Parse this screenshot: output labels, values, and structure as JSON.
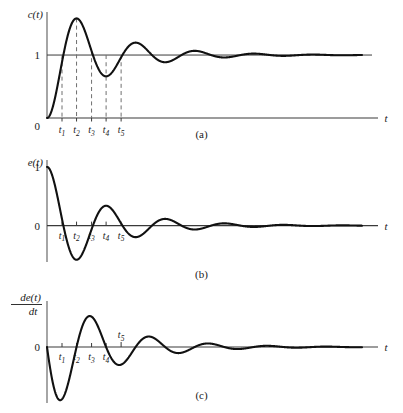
{
  "figure": {
    "background": "#ffffff",
    "ink": "#111111",
    "axis_color": "#3a3a3a",
    "dash_color": "#6f6f6f"
  },
  "panels": [
    {
      "id": "a",
      "caption": "(a)",
      "ylabel": "c(t)",
      "xlabel": "t",
      "origin_label": "0",
      "level_label": "1",
      "tick_labels": [
        "t1",
        "t2",
        "t3",
        "t4",
        "t5"
      ],
      "tick_sub": [
        "1",
        "2",
        "3",
        "4",
        "5"
      ],
      "tick_label_base": "t",
      "tick_label_position": "below-axis",
      "has_dashed_droplines": true,
      "has_level_line": true,
      "description": "Underdamped second-order step response rising from 0, overshooting the steady-state value 1, then ringing down to 1."
    },
    {
      "id": "b",
      "caption": "(b)",
      "ylabel": "e(t)",
      "xlabel": "t",
      "origin_label": "0",
      "level_label": "1",
      "tick_labels": [
        "t1",
        "t2",
        "t3",
        "t4",
        "t5"
      ],
      "tick_sub": [
        "1",
        "2",
        "3",
        "4",
        "5"
      ],
      "tick_label_base": "t",
      "tick_label_position": "below-axis",
      "has_dashed_droplines": false,
      "has_level_line": false,
      "description": "Error signal e(t) = 1 - c(t), starting at 1 and oscillating with decaying amplitude about 0."
    },
    {
      "id": "c",
      "caption": "(c)",
      "ylabel_numerator": "de(t)",
      "ylabel_denominator": "dt",
      "xlabel": "t",
      "origin_label": "0",
      "tick_labels": [
        "t1",
        "t2",
        "t3",
        "t4",
        "t5"
      ],
      "tick_sub": [
        "1",
        "2",
        "3",
        "4",
        "5"
      ],
      "tick_label_base": "t",
      "tick_label_position": "below-axis-except-t5",
      "t5_label_position": "above-axis",
      "has_dashed_droplines": false,
      "has_level_line": false,
      "description": "Derivative of the error signal, starting at 0, dipping negative first, then oscillating with decaying amplitude about 0."
    }
  ],
  "chart_data": {
    "type": "line",
    "title": "",
    "xlabel": "t",
    "plots": [
      {
        "name": "c(t)",
        "panel": "a",
        "ylabel": "c(t)",
        "yticks": [
          0,
          1
        ],
        "ytick_labels": [
          "0",
          "1"
        ],
        "model": "step_response",
        "formula": "c(t) = 1 - exp(-z*wn*t)*(cos(wd*t) + (z*wn/wd)*sin(wd*t))",
        "zeta": 0.17,
        "wn": 1.0,
        "wd": 0.98536,
        "xlim": [
          0,
          34
        ],
        "ylim": [
          0,
          1.62
        ],
        "steady_state": 1,
        "peak_value": 1.575,
        "peak_time": 3.19,
        "marker_times": [
          1.62,
          3.19,
          4.81,
          6.38,
          8.0
        ],
        "marker_labels": [
          "t1",
          "t2",
          "t3",
          "t4",
          "t5"
        ],
        "grid": false,
        "legend": false
      },
      {
        "name": "e(t)",
        "panel": "b",
        "ylabel": "e(t)",
        "yticks": [
          0,
          1
        ],
        "ytick_labels": [
          "0",
          "1"
        ],
        "model": "error",
        "formula": "e(t) = exp(-z*wn*t)*(cos(wd*t) + (z*wn/wd)*sin(wd*t))",
        "zeta": 0.17,
        "wn": 1.0,
        "wd": 0.98536,
        "xlim": [
          0,
          34
        ],
        "ylim": [
          -0.62,
          1.05
        ],
        "initial_value": 1,
        "marker_times": [
          1.62,
          3.19,
          4.81,
          6.38,
          8.0
        ],
        "marker_labels": [
          "t1",
          "t2",
          "t3",
          "t4",
          "t5"
        ],
        "grid": false,
        "legend": false
      },
      {
        "name": "de(t)/dt",
        "panel": "c",
        "ylabel_numerator": "de(t)",
        "ylabel_denominator": "dt",
        "yticks": [
          0
        ],
        "ytick_labels": [
          "0"
        ],
        "model": "error_derivative",
        "formula": "de/dt = -(wn/sqrt(1-z^2))*exp(-z*wn*t)*sin(wd*t)",
        "zeta": 0.17,
        "wn": 1.0,
        "wd": 0.98536,
        "xlim": [
          0,
          34
        ],
        "ylim": [
          -0.62,
          0.62
        ],
        "initial_value": 0,
        "marker_times": [
          1.62,
          3.19,
          4.81,
          6.38,
          8.0
        ],
        "marker_labels": [
          "t1",
          "t2",
          "t3",
          "t4",
          "t5"
        ],
        "grid": false,
        "legend": false
      }
    ]
  }
}
